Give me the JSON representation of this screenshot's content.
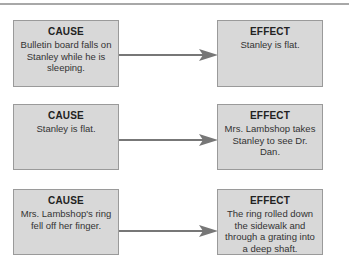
{
  "rows": [
    {
      "cause": {
        "title": "CAUSE",
        "text": "Bulletin board falls on Stanley while he is sleeping."
      },
      "effect": {
        "title": "EFFECT",
        "text": "Stanley is flat."
      }
    },
    {
      "cause": {
        "title": "CAUSE",
        "text": "Stanley is flat."
      },
      "effect": {
        "title": "EFFECT",
        "text": "Mrs. Lambshop takes Stanley to see Dr. Dan."
      }
    },
    {
      "cause": {
        "title": "CAUSE",
        "text": "Mrs. Lambshop's ring fell off  her finger."
      },
      "effect": {
        "title": "EFFECT",
        "text": "The ring rolled down the sidewalk and through a grating into a deep shaft."
      }
    }
  ],
  "colors": {
    "box_fill": "#d8d8d8",
    "box_border": "#9a9a9a",
    "arrow": "#777777"
  }
}
